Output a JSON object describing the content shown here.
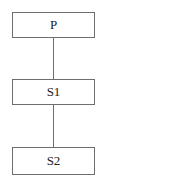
{
  "diagram": {
    "type": "tree",
    "nodes": [
      {
        "id": "P",
        "label": "P"
      },
      {
        "id": "S1",
        "label": "S1"
      },
      {
        "id": "S2",
        "label": "S2"
      }
    ],
    "edges": [
      {
        "from": "P",
        "to": "S1"
      },
      {
        "from": "S1",
        "to": "S2"
      }
    ]
  }
}
